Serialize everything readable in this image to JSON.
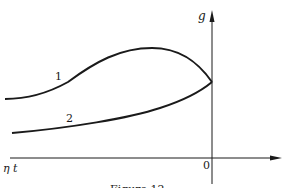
{
  "diagram": {
    "y_axis_label": "g",
    "x_axis_label": "η t",
    "origin_label": "0",
    "curves": [
      {
        "id": "1",
        "label": "1"
      },
      {
        "id": "2",
        "label": "2"
      }
    ],
    "caption": "Figure 12",
    "colors": {
      "ink": "#1a1a1a",
      "background": "#ffffff"
    }
  }
}
